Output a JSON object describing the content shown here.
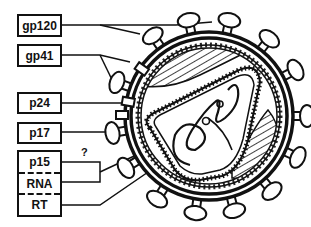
{
  "diagram": {
    "labels": [
      {
        "id": "gp120",
        "text": "gp120"
      },
      {
        "id": "gp41",
        "text": "gp41"
      },
      {
        "id": "p24",
        "text": "p24"
      },
      {
        "id": "p17",
        "text": "p17"
      },
      {
        "id": "p15",
        "text": "p15"
      },
      {
        "id": "rna",
        "text": "RNA"
      },
      {
        "id": "rt",
        "text": "RT"
      }
    ],
    "uncertain_marker": "?",
    "colors": {
      "ink": "#111111",
      "background": "#ffffff"
    }
  }
}
